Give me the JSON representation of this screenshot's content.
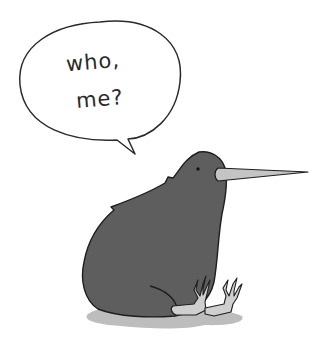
{
  "speech_bubble": {
    "line1": "who,",
    "line2": "me?"
  },
  "colors": {
    "background": "#ffffff",
    "body": "#5e5e5e",
    "outline": "#1e1e1e",
    "beak": "#c4c4c4",
    "feet": "#cfcfcf",
    "shadow": "#bdbdbd",
    "bubble_fill": "#ffffff",
    "bubble_stroke": "#2a2a2a"
  }
}
